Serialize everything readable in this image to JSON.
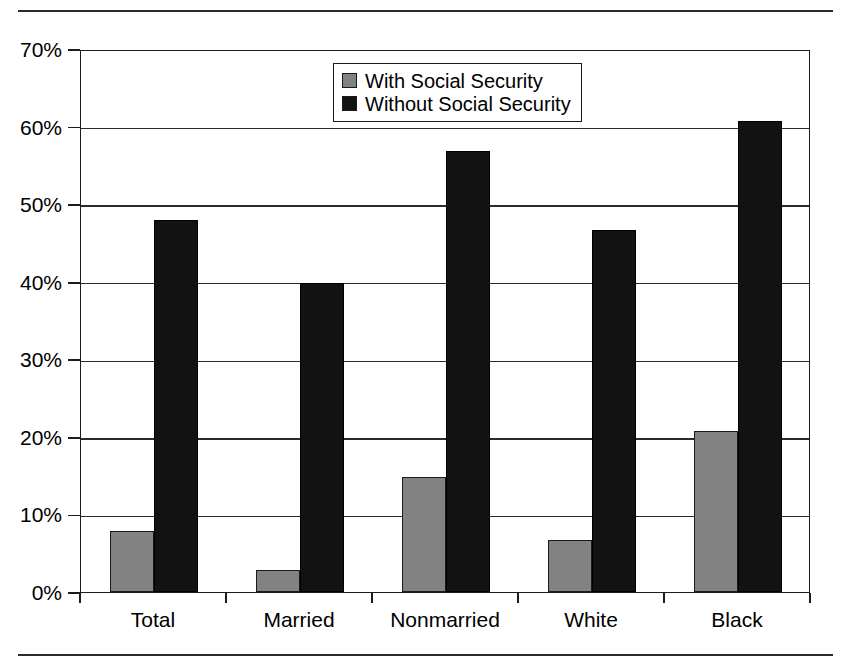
{
  "chart_data": {
    "type": "bar",
    "title": "",
    "subtitle": "",
    "xlabel": "",
    "ylabel": "",
    "ylim": [
      0,
      70
    ],
    "ytick_labels": [
      "0%",
      "10%",
      "20%",
      "30%",
      "40%",
      "50%",
      "60%",
      "70%"
    ],
    "ytick_values": [
      0,
      10,
      20,
      30,
      40,
      50,
      60,
      70
    ],
    "grid": "horizontal",
    "legend_position": "top-center",
    "categories": [
      "Total",
      "Married",
      "Nonmarried",
      "White",
      "Black"
    ],
    "series": [
      {
        "name": "With Social Security",
        "color": "#828282",
        "values": [
          7.9,
          2.8,
          14.8,
          6.7,
          20.7
        ]
      },
      {
        "name": "Without Social Security",
        "color": "#121212",
        "values": [
          47.9,
          39.9,
          56.8,
          46.7,
          60.7
        ]
      }
    ]
  },
  "legend": {
    "items": [
      {
        "label": "With Social Security",
        "swatch": "gray-swatch"
      },
      {
        "label": "Without Social Security",
        "swatch": "black-swatch"
      }
    ]
  },
  "axis": {
    "y_ticks": [
      "70%",
      "60%",
      "50%",
      "40%",
      "30%",
      "20%",
      "10%",
      "0%"
    ],
    "x_ticks": [
      "Total",
      "Married",
      "Nonmarried",
      "White",
      "Black"
    ]
  }
}
